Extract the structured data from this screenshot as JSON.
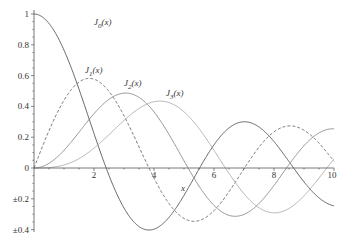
{
  "chart_data": {
    "type": "line",
    "title": "",
    "xlabel": "x",
    "ylabel": "",
    "xlim": [
      0,
      10
    ],
    "ylim": [
      -0.4,
      1
    ],
    "grid": false,
    "legend": "inline curve labels",
    "x_ticks": [
      {
        "value": 2,
        "label": "2"
      },
      {
        "value": 4,
        "label": "4"
      },
      {
        "value": 6,
        "label": "6"
      },
      {
        "value": 8,
        "label": "8"
      },
      {
        "value": 10,
        "label": "10"
      }
    ],
    "y_ticks": [
      {
        "value": 1,
        "label": "1"
      },
      {
        "value": 0.8,
        "label": "0.8"
      },
      {
        "value": 0.6,
        "label": "0.6"
      },
      {
        "value": 0.4,
        "label": "0.4"
      },
      {
        "value": 0.2,
        "label": "0.2"
      },
      {
        "value": 0,
        "label": "0"
      },
      {
        "value": -0.2,
        "label": "±0.2"
      },
      {
        "value": -0.4,
        "label": "±0.4"
      }
    ],
    "x": [
      0,
      1,
      2,
      3,
      4,
      5,
      6,
      7,
      8,
      9,
      10
    ],
    "series": [
      {
        "name": "J0(x)",
        "order": 0,
        "color": "#555555",
        "dash": "",
        "values": [
          1.0,
          0.765,
          0.224,
          -0.26,
          -0.397,
          -0.178,
          0.151,
          0.3,
          0.172,
          -0.09,
          -0.246
        ],
        "label_pos": [
          2.0,
          0.93
        ]
      },
      {
        "name": "J1(x)",
        "order": 1,
        "color": "#666666",
        "dash": "3,2",
        "values": [
          0.0,
          0.44,
          0.577,
          0.339,
          -0.066,
          -0.328,
          -0.277,
          -0.005,
          0.235,
          0.245,
          0.043
        ],
        "label_pos": [
          1.7,
          0.62
        ]
      },
      {
        "name": "J2(x)",
        "order": 2,
        "color": "#888888",
        "dash": "",
        "values": [
          0.0,
          0.115,
          0.353,
          0.486,
          0.364,
          0.047,
          -0.243,
          -0.301,
          -0.113,
          0.145,
          0.255
        ],
        "label_pos": [
          3.0,
          0.53
        ]
      },
      {
        "name": "J3(x)",
        "order": 3,
        "color": "#aaaaaa",
        "dash": "",
        "values": [
          0.0,
          0.02,
          0.129,
          0.309,
          0.43,
          0.365,
          0.115,
          -0.168,
          -0.291,
          -0.181,
          0.058
        ],
        "label_pos": [
          4.4,
          0.465
        ]
      }
    ]
  },
  "labels": {
    "xlabel": "x",
    "curves": [
      {
        "base": "J",
        "sub": "0",
        "arg": "(x)"
      },
      {
        "base": "J",
        "sub": "1",
        "arg": "(x)"
      },
      {
        "base": "J",
        "sub": "2",
        "arg": "(x)"
      },
      {
        "base": "J",
        "sub": "3",
        "arg": "(x)"
      }
    ]
  }
}
